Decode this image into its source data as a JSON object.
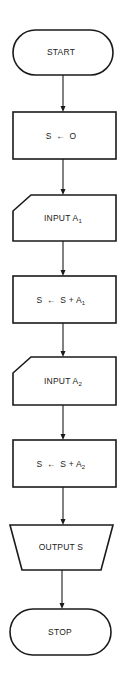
{
  "diagram": {
    "type": "flowchart",
    "direction": "top-to-bottom",
    "colors": {
      "stroke": "#1a1a1a",
      "fill": "#ffffff",
      "text": "#222222"
    },
    "nodes": [
      {
        "id": "start",
        "shape": "terminal",
        "label": "START"
      },
      {
        "id": "init",
        "shape": "process",
        "label": "S ← O",
        "lhs": "S",
        "assign_symbol": "←",
        "rhs": "O"
      },
      {
        "id": "input1",
        "shape": "manual-input",
        "label": "INPUT A1",
        "text": "INPUT A",
        "subscript": "1"
      },
      {
        "id": "add1",
        "shape": "process",
        "label": "S ← S + A1",
        "lhs": "S",
        "assign_symbol": "←",
        "rhs": "S + A",
        "subscript": "1"
      },
      {
        "id": "input2",
        "shape": "manual-input",
        "label": "INPUT A2",
        "text": "INPUT A",
        "subscript": "2"
      },
      {
        "id": "add2",
        "shape": "process",
        "label": "S ← S + A2",
        "lhs": "S",
        "assign_symbol": "←",
        "rhs": "S + A",
        "subscript": "2"
      },
      {
        "id": "output",
        "shape": "manual-operation",
        "label": "OUTPUT S"
      },
      {
        "id": "stop",
        "shape": "terminal",
        "label": "STOP"
      }
    ],
    "edges": [
      {
        "from": "start",
        "to": "init"
      },
      {
        "from": "init",
        "to": "input1"
      },
      {
        "from": "input1",
        "to": "add1"
      },
      {
        "from": "add1",
        "to": "input2"
      },
      {
        "from": "input2",
        "to": "add2"
      },
      {
        "from": "add2",
        "to": "output"
      },
      {
        "from": "output",
        "to": "stop"
      }
    ]
  }
}
